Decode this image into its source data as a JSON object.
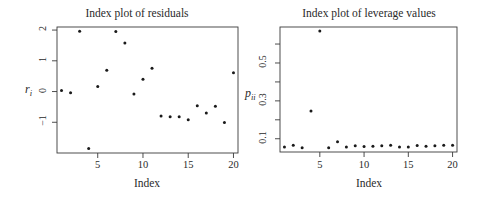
{
  "chart_data": [
    {
      "type": "scatter",
      "title": "Index plot of residuals",
      "xlabel": "Index",
      "ylabel": "r_i",
      "ylabel_main": "r",
      "ylabel_sub": "i",
      "xlim": [
        0.5,
        20.5
      ],
      "ylim": [
        -2.0,
        2.1
      ],
      "xticks": [
        5,
        10,
        15,
        20
      ],
      "xtick_labels": [
        "5",
        "10",
        "15",
        "20"
      ],
      "yticks": [
        -1,
        0,
        1,
        2
      ],
      "ytick_labels": [
        "−1",
        "0",
        "1",
        "2"
      ],
      "grid": false,
      "x": [
        1,
        2,
        3,
        4,
        5,
        6,
        7,
        8,
        9,
        10,
        11,
        12,
        13,
        14,
        15,
        16,
        17,
        18,
        19,
        20
      ],
      "y": [
        0.03,
        -0.04,
        1.96,
        -1.85,
        0.16,
        0.69,
        1.95,
        1.58,
        -0.08,
        0.4,
        0.76,
        -0.8,
        -0.82,
        -0.82,
        -0.92,
        -0.46,
        -0.7,
        -0.48,
        -1.01,
        0.61
      ]
    },
    {
      "type": "scatter",
      "title": "Index plot of leverage values",
      "xlabel": "Index",
      "ylabel": "p_ii",
      "ylabel_main": "p",
      "ylabel_sub": "ii",
      "xlim": [
        0.5,
        20.5
      ],
      "ylim": [
        0.03,
        0.69
      ],
      "xticks": [
        5,
        10,
        15,
        20
      ],
      "xtick_labels": [
        "5",
        "10",
        "15",
        "20"
      ],
      "yticks": [
        0.1,
        0.2,
        0.3,
        0.4,
        0.5,
        0.6
      ],
      "ytick_labels": [
        "0.1",
        "",
        "0.3",
        "",
        "0.5",
        ""
      ],
      "grid": false,
      "x": [
        1,
        2,
        3,
        4,
        5,
        6,
        7,
        8,
        9,
        10,
        11,
        12,
        13,
        14,
        15,
        16,
        17,
        18,
        19,
        20
      ],
      "y": [
        0.056,
        0.066,
        0.052,
        0.247,
        0.669,
        0.052,
        0.084,
        0.057,
        0.063,
        0.059,
        0.061,
        0.063,
        0.066,
        0.056,
        0.056,
        0.064,
        0.061,
        0.063,
        0.066,
        0.066
      ]
    }
  ],
  "colors": {
    "points": "#1a1a1a",
    "axes": "#3a3a3a",
    "background": "#ffffff"
  }
}
